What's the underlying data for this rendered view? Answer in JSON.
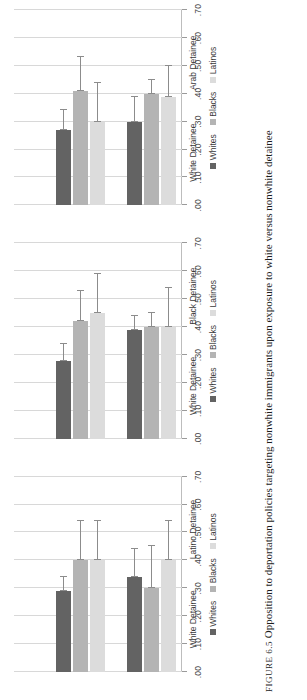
{
  "caption": {
    "figure_number": "FIGURE 6.5",
    "text": "Opposition to deportation policies targeting nonwhite immigrants upon exposure to white versus nonwhite detainee"
  },
  "axis": {
    "ylabel": "",
    "xlabel": "",
    "ticks": [
      ".00",
      ".10",
      ".20",
      ".30",
      ".40",
      ".50",
      ".60",
      ".70"
    ],
    "lim": [
      0,
      0.7
    ]
  },
  "legend": [
    {
      "label": "Whites",
      "color": "#636363"
    },
    {
      "label": "Blacks",
      "color": "#b4b4b4"
    },
    {
      "label": "Latinos",
      "color": "#dcdcdc"
    }
  ],
  "chart_data": {
    "type": "bar",
    "orientation": "horizontal",
    "title": "",
    "xlabel": "",
    "ylabel": "",
    "xlim": [
      0,
      0.7
    ],
    "xticks": [
      0.0,
      0.1,
      0.2,
      0.3,
      0.4,
      0.5,
      0.6,
      0.7
    ],
    "xticklabels": [
      ".00",
      ".10",
      ".20",
      ".30",
      ".40",
      ".50",
      ".60",
      ".70"
    ],
    "grid": true,
    "legend_position": "bottom",
    "series": [
      {
        "name": "Whites",
        "color": "#636363"
      },
      {
        "name": "Blacks",
        "color": "#b4b4b4"
      },
      {
        "name": "Latinos",
        "color": "#dcdcdc"
      }
    ],
    "panels": [
      {
        "name": "panel-latino-detainee",
        "categories": [
          "White Detainee",
          "Latino Detainee"
        ],
        "groups": [
          {
            "category": "White Detainee",
            "bars": [
              {
                "series": "Whites",
                "value": 0.34,
                "ci_low": 0.34,
                "ci_high": 0.44
              },
              {
                "series": "Blacks",
                "value": 0.3,
                "ci_low": 0.3,
                "ci_high": 0.45
              },
              {
                "series": "Latinos",
                "value": 0.4,
                "ci_low": 0.4,
                "ci_high": 0.54
              }
            ]
          },
          {
            "category": "Latino Detainee",
            "bars": [
              {
                "series": "Whites",
                "value": 0.29,
                "ci_low": 0.29,
                "ci_high": 0.34
              },
              {
                "series": "Blacks",
                "value": 0.4,
                "ci_low": 0.4,
                "ci_high": 0.54
              },
              {
                "series": "Latinos",
                "value": 0.4,
                "ci_low": 0.4,
                "ci_high": 0.54
              }
            ]
          }
        ]
      },
      {
        "name": "panel-black-detainee",
        "categories": [
          "White Detainee",
          "Black Detainee"
        ],
        "groups": [
          {
            "category": "White Detainee",
            "bars": [
              {
                "series": "Whites",
                "value": 0.39,
                "ci_low": 0.39,
                "ci_high": 0.44
              },
              {
                "series": "Blacks",
                "value": 0.4,
                "ci_low": 0.4,
                "ci_high": 0.45
              },
              {
                "series": "Latinos",
                "value": 0.4,
                "ci_low": 0.4,
                "ci_high": 0.54
              }
            ]
          },
          {
            "category": "Black Detainee",
            "bars": [
              {
                "series": "Whites",
                "value": 0.28,
                "ci_low": 0.28,
                "ci_high": 0.34
              },
              {
                "series": "Blacks",
                "value": 0.42,
                "ci_low": 0.42,
                "ci_high": 0.53
              },
              {
                "series": "Latinos",
                "value": 0.45,
                "ci_low": 0.45,
                "ci_high": 0.59
              }
            ]
          }
        ]
      },
      {
        "name": "panel-arab-detainee",
        "categories": [
          "White Detainee",
          "Arab Detainee"
        ],
        "groups": [
          {
            "category": "White Detainee",
            "bars": [
              {
                "series": "Whites",
                "value": 0.3,
                "ci_low": 0.3,
                "ci_high": 0.39
              },
              {
                "series": "Blacks",
                "value": 0.4,
                "ci_low": 0.4,
                "ci_high": 0.45
              },
              {
                "series": "Latinos",
                "value": 0.39,
                "ci_low": 0.39,
                "ci_high": 0.5
              }
            ]
          },
          {
            "category": "Arab Detainee",
            "bars": [
              {
                "series": "Whites",
                "value": 0.27,
                "ci_low": 0.27,
                "ci_high": 0.34
              },
              {
                "series": "Blacks",
                "value": 0.41,
                "ci_low": 0.41,
                "ci_high": 0.53
              },
              {
                "series": "Latinos",
                "value": 0.3,
                "ci_low": 0.3,
                "ci_high": 0.44
              }
            ]
          }
        ]
      }
    ]
  }
}
